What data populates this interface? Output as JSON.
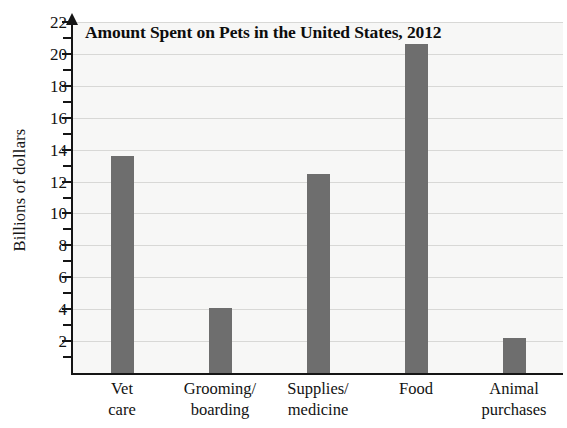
{
  "chart_data": {
    "type": "bar",
    "title": "Amount Spent on Pets in the United States, 2012",
    "xlabel": "",
    "ylabel": "Billions of dollars",
    "categories": [
      "Vet care",
      "Grooming/ boarding",
      "Supplies/ medicine",
      "Food",
      "Animal purchases"
    ],
    "category_lines": [
      [
        "Vet",
        "care"
      ],
      [
        "Grooming/",
        "boarding"
      ],
      [
        "Supplies/",
        "medicine"
      ],
      [
        "Food",
        ""
      ],
      [
        "Animal",
        "purchases"
      ]
    ],
    "values": [
      13.6,
      4.1,
      12.5,
      20.6,
      2.2
    ],
    "ylim": [
      0,
      22
    ],
    "y_major_ticks": [
      2,
      4,
      6,
      8,
      10,
      12,
      14,
      16,
      18,
      20,
      22
    ],
    "y_minor_ticks": [
      1,
      3,
      5,
      7,
      9,
      11,
      13,
      15,
      17,
      19,
      21
    ],
    "y_tick_labels": [
      "2",
      "4",
      "6",
      "8",
      "10",
      "12",
      "14",
      "16",
      "18",
      "20",
      "22"
    ],
    "gridlines": true,
    "legend": null,
    "bar_color": "#6e6e6e",
    "plot_background": "#f7f7f6",
    "axis_color": "#151515",
    "gridline_color": "#d8d8d6"
  }
}
